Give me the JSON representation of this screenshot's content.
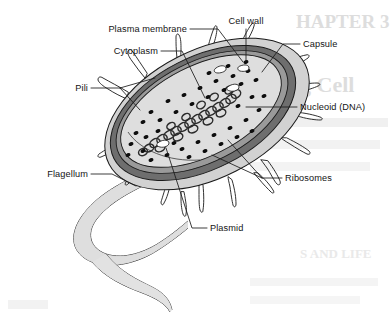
{
  "figure": {
    "background_color": "#ffffff",
    "ink_color": "#1a1a1a"
  },
  "labels": [
    {
      "id": "plasma-membrane",
      "text": "Plasma membrane",
      "align": "end",
      "x": 187,
      "y": 32
    },
    {
      "id": "cell-wall",
      "text": "Cell wall",
      "align": "mid",
      "x": 246,
      "y": 24
    },
    {
      "id": "capsule",
      "text": "Capsule",
      "align": "start",
      "x": 303,
      "y": 47
    },
    {
      "id": "cytoplasm",
      "text": "Cytoplasm",
      "align": "end",
      "x": 158,
      "y": 54
    },
    {
      "id": "pili",
      "text": "Pili",
      "align": "end",
      "x": 88,
      "y": 91
    },
    {
      "id": "nucleoid-dna",
      "text": "Nucleoid (DNA)",
      "align": "start",
      "x": 300,
      "y": 110
    },
    {
      "id": "flagellum",
      "text": "Flagellum",
      "align": "end",
      "x": 88,
      "y": 177
    },
    {
      "id": "ribosomes",
      "text": "Ribosomes",
      "align": "start",
      "x": 285,
      "y": 181
    },
    {
      "id": "plasmid",
      "text": "Plasmid",
      "align": "start",
      "x": 210,
      "y": 231
    }
  ],
  "structures": {
    "capsule": {
      "name": "Capsule",
      "fill": "#cfcfcf",
      "role": "outermost sticky layer"
    },
    "cell_wall": {
      "name": "Cell wall",
      "fill": "#6e6e6e",
      "role": "rigid protective layer"
    },
    "plasma_membrane": {
      "name": "Plasma membrane",
      "fill": "#8a8a8a",
      "role": "selectively permeable boundary"
    },
    "cytoplasm": {
      "name": "Cytoplasm",
      "fill": "#dedede",
      "role": "gel interior of the cell"
    },
    "nucleoid": {
      "name": "Nucleoid (DNA)",
      "fill": "#3a3a3a",
      "role": "coiled circular chromosome"
    },
    "ribosomes": {
      "name": "Ribosomes",
      "fill": "#0d0d0d",
      "role": "protein synthesis granules",
      "count": 41
    },
    "plasmid": {
      "name": "Plasmid",
      "fill": "#ffffff",
      "role": "small circular DNA loops",
      "count": 4
    },
    "pili": {
      "name": "Pili",
      "fill": "#e3e3e3",
      "role": "short surface projections",
      "count": 17
    },
    "flagellum": {
      "name": "Flagellum",
      "fill": "#dcdcdc",
      "role": "long whip-like tail for motility"
    }
  },
  "background_text": {
    "note": "faint bleed-through text from reverse of page",
    "lines": [
      {
        "text": "HAPTER 3",
        "x": 296,
        "y": 28,
        "size": 19,
        "faint": false
      },
      {
        "text": "g Cell",
        "x": 300,
        "y": 92,
        "size": 22,
        "faint": false
      },
      {
        "text": "S AND LIFE",
        "x": 300,
        "y": 258,
        "size": 13,
        "faint": true
      }
    ]
  }
}
